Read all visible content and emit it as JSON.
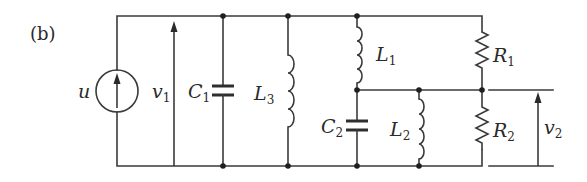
{
  "figure": {
    "panel_label": "(b)",
    "colors": {
      "line": "#3a3a3a",
      "background": "#ffffff",
      "node": "#1f1f1f"
    }
  },
  "labels": {
    "source": {
      "main": "u",
      "sub": ""
    },
    "v1": {
      "main": "v",
      "sub": "1"
    },
    "c1": {
      "main": "C",
      "sub": "1"
    },
    "l3": {
      "main": "L",
      "sub": "3"
    },
    "l1": {
      "main": "L",
      "sub": "1"
    },
    "c2": {
      "main": "C",
      "sub": "2"
    },
    "l2": {
      "main": "L",
      "sub": "2"
    },
    "r1": {
      "main": "R",
      "sub": "1"
    },
    "r2": {
      "main": "R",
      "sub": "2"
    },
    "v2": {
      "main": "v",
      "sub": "2"
    }
  },
  "components": [
    {
      "id": "u",
      "type": "current-source",
      "direction": "up"
    },
    {
      "id": "v1",
      "type": "voltage-arrow",
      "direction": "up"
    },
    {
      "id": "C1",
      "type": "capacitor"
    },
    {
      "id": "L3",
      "type": "inductor"
    },
    {
      "id": "L1",
      "type": "inductor"
    },
    {
      "id": "C2",
      "type": "capacitor"
    },
    {
      "id": "L2",
      "type": "inductor"
    },
    {
      "id": "R1",
      "type": "resistor"
    },
    {
      "id": "R2",
      "type": "resistor"
    },
    {
      "id": "v2",
      "type": "voltage-arrow",
      "direction": "up"
    }
  ]
}
